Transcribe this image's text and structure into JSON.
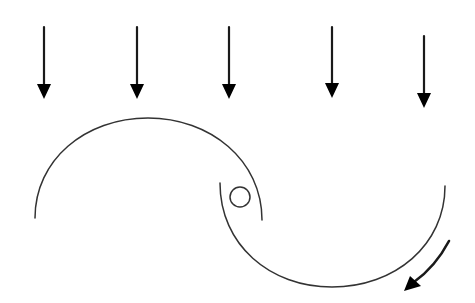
{
  "diagram": {
    "wind_arrows": {
      "count": 5,
      "direction": "down",
      "label": ""
    },
    "blades": [
      {
        "name": "upper-blade",
        "shape": "arc",
        "opening": "down"
      },
      {
        "name": "lower-blade",
        "shape": "arc",
        "opening": "up"
      }
    ],
    "hub": {
      "shape": "circle",
      "position": "center"
    },
    "rotation_arrow": {
      "direction": "clockwise",
      "position": "bottom-right"
    },
    "colors": {
      "stroke": "#1a1a1a",
      "background": "#ffffff"
    }
  }
}
